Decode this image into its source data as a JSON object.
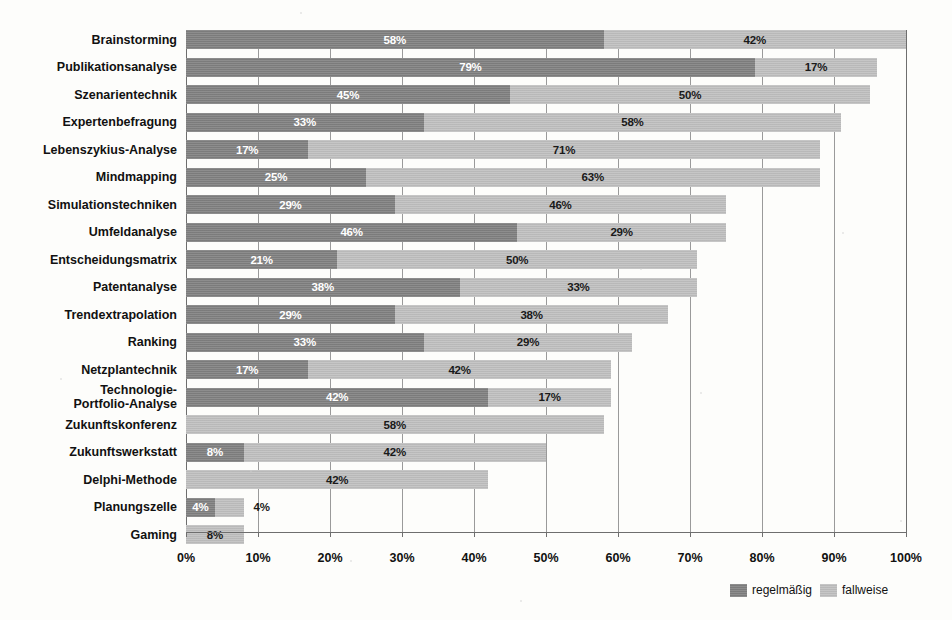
{
  "chart_data": {
    "type": "bar",
    "orientation": "horizontal",
    "stacked": true,
    "title": "",
    "subtitle": "",
    "xlabel": "",
    "ylabel": "",
    "xlim": [
      0,
      100
    ],
    "xticks": [
      "0%",
      "10%",
      "20%",
      "30%",
      "40%",
      "50%",
      "60%",
      "70%",
      "80%",
      "90%",
      "100%"
    ],
    "xtick_values": [
      0,
      10,
      20,
      30,
      40,
      50,
      60,
      70,
      80,
      90,
      100
    ],
    "grid": true,
    "grid_axis": "x",
    "legend_position": "bottom-right",
    "categories": [
      "Brainstorming",
      "Publikationsanalyse",
      "Szenarientechnik",
      "Expertenbefragung",
      "Lebenszykius-Analyse",
      "Mindmapping",
      "Simulationstechniken",
      "Umfeldanalyse",
      "Entscheidungsmatrix",
      "Patentanalyse",
      "Trendextrapolation",
      "Ranking",
      "Netzplantechnik",
      "Technologie-\nPortfolio-Analyse",
      "Zukunftskonferenz",
      "Zukunftswerkstatt",
      "Delphi-Methode",
      "Planungszelle",
      "Gaming"
    ],
    "series": [
      {
        "name": "regelmäßig",
        "color": "#828282",
        "values": [
          58,
          79,
          45,
          33,
          17,
          25,
          29,
          46,
          21,
          38,
          29,
          33,
          17,
          42,
          0,
          8,
          0,
          4,
          0
        ],
        "labels": [
          "58%",
          "79%",
          "45%",
          "33%",
          "17%",
          "25%",
          "29%",
          "46%",
          "21%",
          "38%",
          "29%",
          "33%",
          "17%",
          "42%",
          "",
          "8%",
          "",
          "4%",
          ""
        ]
      },
      {
        "name": "fallweise",
        "color": "#c0c0c0",
        "values": [
          42,
          17,
          50,
          58,
          71,
          63,
          46,
          29,
          50,
          33,
          38,
          29,
          42,
          17,
          58,
          42,
          42,
          4,
          8
        ],
        "labels": [
          "42%",
          "17%",
          "50%",
          "58%",
          "71%",
          "63%",
          "46%",
          "29%",
          "50%",
          "33%",
          "38%",
          "29%",
          "42%",
          "17%",
          "58%",
          "42%",
          "42%",
          "4%",
          "8%"
        ]
      }
    ],
    "totals": [
      100,
      96,
      95,
      91,
      88,
      88,
      75,
      75,
      71,
      71,
      67,
      62,
      59,
      59,
      58,
      50,
      42,
      8,
      8
    ]
  },
  "legend": {
    "entries": [
      {
        "label": "regelmäßig",
        "color": "#828282"
      },
      {
        "label": "fallweise",
        "color": "#c0c0c0"
      }
    ]
  },
  "colors": {
    "regelmaessig": "#828282",
    "fallweise": "#c0c0c0",
    "gridline": "#9a9a9a",
    "axis": "#6e6e6e",
    "background": "#fdfdfb",
    "text": "#111111"
  }
}
